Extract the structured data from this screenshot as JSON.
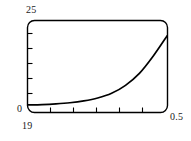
{
  "figure": {
    "background_color": "#ffffff",
    "frame_color": "#000000",
    "curve_color": "#000000"
  },
  "labels": {
    "y_max": "25",
    "y_min": "0",
    "x_min": "19",
    "x_max": "0.5"
  },
  "chart_data": {
    "type": "line",
    "title": "",
    "subtitle": "",
    "xlabel": "",
    "ylabel": "",
    "grid": false,
    "legend": null,
    "frame": "rounded-rectangle",
    "xlim": [
      19,
      0.5
    ],
    "ylim": [
      0,
      25
    ],
    "x_tick_labels": [
      "19",
      "0.5"
    ],
    "y_tick_labels": [
      "0",
      "25"
    ],
    "x_minor_tick_count": 5,
    "y_minor_tick_count": 5,
    "series": [
      {
        "name": "curve",
        "x": [
          19.0,
          17.15,
          15.3,
          13.45,
          11.6,
          9.75,
          7.9,
          6.05,
          4.2,
          2.35,
          0.5
        ],
        "values": [
          1.9,
          2.0,
          2.2,
          2.5,
          3.0,
          3.8,
          5.1,
          7.3,
          10.6,
          15.4,
          21.0
        ]
      }
    ],
    "annotations": []
  }
}
